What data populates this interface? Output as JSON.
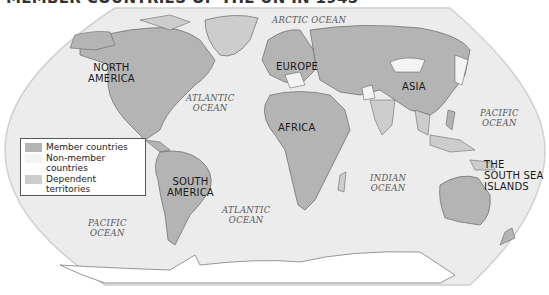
{
  "title": "MEMBER COUNTRIES OF THE UN IN 1945",
  "continents": [
    {
      "name": "north-america",
      "label_line1": "NORTH",
      "label_line2": "AMERICA"
    },
    {
      "name": "south-america",
      "label_line1": "SOUTH",
      "label_line2": "AMERICA"
    },
    {
      "name": "europe",
      "label_line1": "EUROPE"
    },
    {
      "name": "africa",
      "label_line1": "AFRICA"
    },
    {
      "name": "asia",
      "label_line1": "ASIA"
    },
    {
      "name": "south-sea-islands",
      "label_line1": "THE",
      "label_line2": "SOUTH SEA",
      "label_line3": "ISLANDS"
    }
  ],
  "oceans": {
    "arctic": "ARCTIC OCEAN",
    "atlantic_north": {
      "line1": "ATLANTIC",
      "line2": "OCEAN"
    },
    "atlantic_south": {
      "line1": "ATLANTIC",
      "line2": "OCEAN"
    },
    "indian": {
      "line1": "INDIAN",
      "line2": "OCEAN"
    },
    "pacific_east": {
      "line1": "PACIFIC",
      "line2": "OCEAN"
    },
    "pacific_west": {
      "line1": "PACIFIC",
      "line2": "OCEAN"
    }
  },
  "legend": {
    "items": [
      {
        "label": "Member countries",
        "color": "#b4b4b4"
      },
      {
        "label": "Non-member countries",
        "color": "#f4f4f4"
      },
      {
        "label": "Dependent territories",
        "color": "#cdcdcd"
      }
    ]
  },
  "colors": {
    "ocean": "#ececec",
    "member": "#b4b4b4",
    "non_member": "#f4f4f4",
    "dependent": "#cdcdcd",
    "border": "#555555"
  }
}
